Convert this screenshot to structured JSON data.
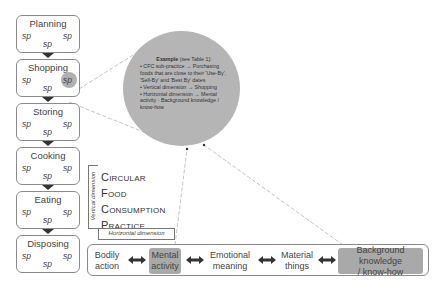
{
  "stages": [
    {
      "title": "Planning",
      "sp": [
        "sp",
        "sp",
        "sp"
      ],
      "highlighted_sp": false
    },
    {
      "title": "Shopping",
      "sp": [
        "sp",
        "sp",
        "sp"
      ],
      "highlighted_sp": true
    },
    {
      "title": "Storing",
      "sp": [
        "sp",
        "sp",
        "sp"
      ],
      "highlighted_sp": false
    },
    {
      "title": "Cooking",
      "sp": [
        "sp",
        "sp",
        "sp"
      ],
      "highlighted_sp": false
    },
    {
      "title": "Eating",
      "sp": [
        "sp",
        "sp",
        "sp"
      ],
      "highlighted_sp": false
    },
    {
      "title": "Disposing",
      "sp": [
        "sp",
        "sp",
        "sp"
      ],
      "highlighted_sp": false
    }
  ],
  "example": {
    "heading_bold": "Example",
    "heading_rest": " (see Table 1):",
    "bullets": [
      "CFC sub-practice → Purchasing foods that are close to their 'Use-By', 'Sell-By' and 'Best By' dates",
      "Vertical dimension → Shopping",
      "Horizontal dimension → Mental activity · Background knowledge / know-how"
    ]
  },
  "center_label": {
    "words": [
      {
        "first": "C",
        "rest": "IRCULAR"
      },
      {
        "first": "F",
        "rest": "OOD"
      },
      {
        "first": "C",
        "rest": "ONSUMPTION"
      },
      {
        "first": "P",
        "rest": "RACTICE"
      }
    ]
  },
  "vertical_dimension_label": "Vertical dimension",
  "horizontal_dimension_label": "Horizontal dimension",
  "horizontal_items": [
    {
      "label_line1": "Bodily",
      "label_line2": "action",
      "highlighted": false
    },
    {
      "label_line1": "Mental",
      "label_line2": "activity",
      "highlighted": true
    },
    {
      "label_line1": "Emotional",
      "label_line2": "meaning",
      "highlighted": false
    },
    {
      "label_line1": "Material",
      "label_line2": "things",
      "highlighted": false
    },
    {
      "label_line1": "Background knowledge",
      "label_line2": "/ know-how",
      "highlighted": true
    }
  ],
  "colors": {
    "highlight": "#a9a9a9",
    "circle": "#b5b5b5",
    "border": "#8a8a8a",
    "connector": "#bbbbbb"
  }
}
